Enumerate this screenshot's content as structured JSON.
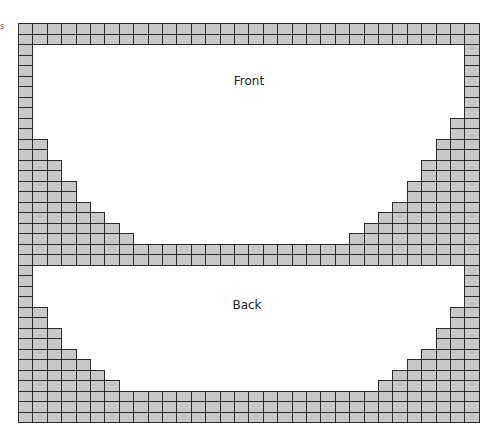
{
  "diagram": {
    "type": "knitting-chart-grid",
    "stray_mark": "s",
    "grid": {
      "columns": 32,
      "cell_width": 14.4,
      "cell_height": 10.5,
      "fill_color": "#c8c8c8",
      "line_color": "#2b2b2b"
    },
    "sections": [
      {
        "label": "Front",
        "label_pos": {
          "x": 249,
          "y": 74
        },
        "rows": [
          {
            "left": 32,
            "right": 0
          },
          {
            "left": 32,
            "right": 0
          },
          {
            "left": 1,
            "right": 1
          },
          {
            "left": 1,
            "right": 1
          },
          {
            "left": 1,
            "right": 1
          },
          {
            "left": 1,
            "right": 1
          },
          {
            "left": 1,
            "right": 1
          },
          {
            "left": 1,
            "right": 1
          },
          {
            "left": 1,
            "right": 1
          },
          {
            "left": 1,
            "right": 2
          },
          {
            "left": 1,
            "right": 2
          },
          {
            "left": 2,
            "right": 3
          },
          {
            "left": 2,
            "right": 3
          },
          {
            "left": 3,
            "right": 4
          },
          {
            "left": 3,
            "right": 4
          },
          {
            "left": 4,
            "right": 5
          },
          {
            "left": 4,
            "right": 5
          },
          {
            "left": 5,
            "right": 6
          },
          {
            "left": 6,
            "right": 7
          },
          {
            "left": 7,
            "right": 8
          },
          {
            "left": 8,
            "right": 9
          },
          {
            "left": 32,
            "right": 0
          },
          {
            "left": 32,
            "right": 0
          }
        ]
      },
      {
        "label": "Back",
        "label_pos": {
          "x": 247,
          "y": 298
        },
        "rows": [
          {
            "left": 1,
            "right": 1
          },
          {
            "left": 1,
            "right": 1
          },
          {
            "left": 1,
            "right": 1
          },
          {
            "left": 1,
            "right": 1
          },
          {
            "left": 2,
            "right": 2
          },
          {
            "left": 2,
            "right": 2
          },
          {
            "left": 3,
            "right": 3
          },
          {
            "left": 3,
            "right": 3
          },
          {
            "left": 4,
            "right": 4
          },
          {
            "left": 5,
            "right": 5
          },
          {
            "left": 6,
            "right": 6
          },
          {
            "left": 7,
            "right": 7
          },
          {
            "left": 32,
            "right": 0
          },
          {
            "left": 32,
            "right": 0
          },
          {
            "left": 32,
            "right": 0
          }
        ]
      }
    ]
  },
  "labels": {
    "front": "Front",
    "back": "Back"
  }
}
